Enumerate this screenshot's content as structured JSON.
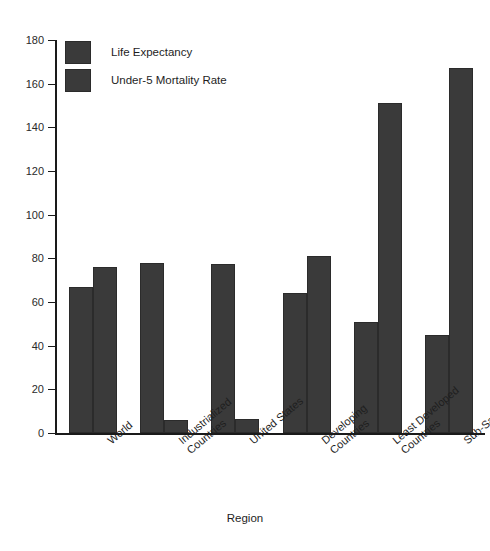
{
  "chart_data": {
    "type": "bar",
    "title": "",
    "xlabel": "Region",
    "ylabel": "",
    "ylim": [
      0,
      180
    ],
    "ytick_step": 20,
    "yticks": [
      180,
      160,
      140,
      120,
      100,
      80,
      60,
      40,
      20,
      0
    ],
    "grid": false,
    "legend_position": "top-left",
    "categories": [
      "World",
      "Industrialized Countries",
      "United States",
      "Developing Countries",
      "Least Developed Countries",
      "Sub-Saharan Africa"
    ],
    "category_lines": [
      [
        "World"
      ],
      [
        "Industrialized",
        "Countries"
      ],
      [
        "United States"
      ],
      [
        "Developing",
        "Countries"
      ],
      [
        "Least Developed",
        "Countries"
      ],
      [
        "Sub-Saharan Africa"
      ]
    ],
    "series": [
      {
        "name": "Life Expectancy",
        "color": "#3a3a3a",
        "values": [
          67,
          78,
          77.5,
          64,
          51,
          45
        ]
      },
      {
        "name": "Under-5 Mortality Rate",
        "color": "#3a3a3a",
        "values": [
          76,
          6,
          6.5,
          81,
          151,
          167
        ]
      }
    ]
  },
  "colors": {
    "bar_fill": "#3a3a3a",
    "bar_stroke": "#2b2b2b",
    "axis": "#1a1a1a",
    "text": "#1e1e1e",
    "plot_background": "#ffffff",
    "page_background": "#c8c8c8"
  }
}
